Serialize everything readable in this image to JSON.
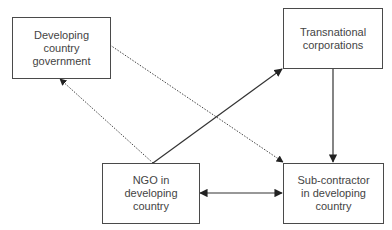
{
  "diagram": {
    "nodes": [
      {
        "id": "gov",
        "label": "Developing\ncountry\ngovernment"
      },
      {
        "id": "tnc",
        "label": "Transnational\ncorporations"
      },
      {
        "id": "ngo",
        "label": "NGO in\ndeveloping\ncountry"
      },
      {
        "id": "sub",
        "label": "Sub-contractor\nin developing\ncountry"
      }
    ],
    "edges": [
      {
        "from": "ngo",
        "to": "tnc",
        "style": "solid",
        "direction": "forward"
      },
      {
        "from": "tnc",
        "to": "sub",
        "style": "solid",
        "direction": "forward"
      },
      {
        "from": "ngo",
        "to": "sub",
        "style": "solid",
        "direction": "both"
      },
      {
        "from": "gov",
        "to": "sub",
        "style": "dotted",
        "direction": "forward"
      },
      {
        "from": "ngo",
        "to": "gov",
        "style": "dotted",
        "direction": "forward"
      }
    ],
    "colors": {
      "line": "#333333",
      "text": "#444444",
      "background": "#ffffff"
    }
  }
}
